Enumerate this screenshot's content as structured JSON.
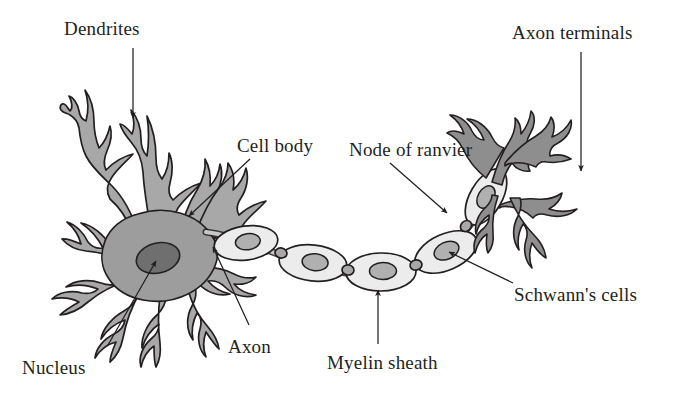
{
  "figure": {
    "background": "#ffffff",
    "ink": "#231f20",
    "colors": {
      "soma_fill": "#9d9d9d",
      "dendrite_fill": "#a8a8a8",
      "nucleus_fill": "#6f6f6f",
      "myelin_fill": "#ececec",
      "schwann_nucleus_fill": "#b0b0b0",
      "terminal_fill": "#8e8e8e",
      "outline": "#231f20"
    }
  },
  "labels": [
    {
      "id": "dendrites",
      "text": "Dendrites",
      "x": 64,
      "y": 18,
      "anchor": "start"
    },
    {
      "id": "axon_terminals",
      "text": "Axon terminals",
      "x": 512,
      "y": 22,
      "anchor": "start"
    },
    {
      "id": "cell_body",
      "text": "Cell body",
      "x": 237,
      "y": 135,
      "anchor": "start"
    },
    {
      "id": "node_of_ranvier",
      "text": "Node of ranvier",
      "x": 349,
      "y": 139,
      "anchor": "start"
    },
    {
      "id": "schwanns_cells",
      "text": "Schwann's cells",
      "x": 514,
      "y": 284,
      "anchor": "start"
    },
    {
      "id": "myelin_sheath",
      "text": "Myelin sheath",
      "x": 327,
      "y": 352,
      "anchor": "start"
    },
    {
      "id": "axon",
      "text": "Axon",
      "x": 228,
      "y": 336,
      "anchor": "start"
    },
    {
      "id": "nucleus",
      "text": "Nucleus",
      "x": 22,
      "y": 357,
      "anchor": "start"
    }
  ],
  "leaders": [
    {
      "id": "dendrites-leader",
      "from": [
        133,
        48
      ],
      "to": [
        133,
        118
      ],
      "head": "end"
    },
    {
      "id": "axon-terminals-leader",
      "from": [
        581,
        52
      ],
      "to": [
        581,
        171
      ],
      "head": "end"
    },
    {
      "id": "cell-body-leader",
      "from": [
        250,
        159
      ],
      "to": [
        189,
        216
      ],
      "head": "end"
    },
    {
      "id": "node-leader",
      "from": [
        390,
        163
      ],
      "to": [
        447,
        213
      ],
      "head": "end"
    },
    {
      "id": "schwanns-leader",
      "from": [
        513,
        283
      ],
      "to": [
        447,
        252
      ],
      "head": "end"
    },
    {
      "id": "myelin-leader",
      "from": [
        378,
        344
      ],
      "to": [
        378,
        288
      ],
      "head": "end"
    },
    {
      "id": "axon-leader",
      "from": [
        249,
        325
      ],
      "to": [
        213,
        249
      ],
      "head": "end"
    },
    {
      "id": "nucleus-leader",
      "from": [
        108,
        345
      ],
      "to": [
        157,
        259
      ],
      "head": "end"
    }
  ],
  "structures": {
    "soma": {
      "name": "cell-body-soma",
      "center": [
        150,
        255
      ]
    },
    "nucleus": {
      "name": "nucleus-ellipse",
      "center": [
        158,
        258
      ],
      "rx": 22,
      "ry": 15
    },
    "myelin_segments": [
      {
        "cx": 246,
        "cy": 243,
        "rx": 32,
        "ry": 17,
        "rot": -8
      },
      {
        "cx": 312,
        "cy": 262,
        "rx": 34,
        "ry": 18,
        "rot": 4
      },
      {
        "cx": 380,
        "cy": 272,
        "rx": 35,
        "ry": 19,
        "rot": -2
      },
      {
        "cx": 446,
        "cy": 252,
        "rx": 33,
        "ry": 18,
        "rot": -22
      },
      {
        "cx": 484,
        "cy": 198,
        "rx": 29,
        "ry": 16,
        "rot": -62
      }
    ],
    "node_gaps": [
      [
        280,
        253
      ],
      [
        347,
        270
      ],
      [
        415,
        264
      ],
      [
        467,
        225
      ]
    ]
  }
}
